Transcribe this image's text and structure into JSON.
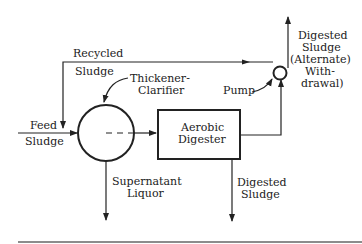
{
  "diagram": {
    "nodes": {
      "thickener": {
        "label_line1": "Thickener-",
        "label_line2": "Clarifier"
      },
      "digester": {
        "label_line1": "Aerobic",
        "label_line2": "Digester"
      },
      "pump": {
        "label": "Pump"
      }
    },
    "flows": {
      "recycled": {
        "label_line1": "Recycled",
        "label_line2": "Sludge"
      },
      "feed": {
        "label_line1": "Feed",
        "label_line2": "Sludge"
      },
      "supernatant": {
        "label_line1": "Supernatant",
        "label_line2": "Liquor"
      },
      "digested_bottom": {
        "label_line1": "Digested",
        "label_line2": "Sludge"
      },
      "digested_alternate": {
        "label_line1": "Digested",
        "label_line2": "Sludge",
        "label_line3": "(Alternate)",
        "label_line4": "With-",
        "label_line5": "drawal)"
      }
    },
    "colors": {
      "line": "#222222",
      "background": "#ffffff"
    }
  }
}
